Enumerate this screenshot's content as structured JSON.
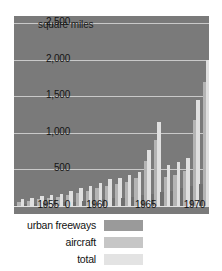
{
  "chart_data": {
    "type": "bar",
    "title": "",
    "ylabel": "square miles",
    "xlabel": "",
    "ylim": [
      0,
      2600
    ],
    "grid": true,
    "legend_position": "bottom",
    "ytick_labels": [
      "2,500",
      "2,000",
      "1,500",
      "1,000",
      "500",
      "0"
    ],
    "ytick_values": [
      2500,
      2000,
      1500,
      1000,
      500,
      0
    ],
    "xtick_labels": [
      "1955",
      "1960",
      "1965",
      "1970"
    ],
    "xtick_values": [
      1955,
      1960,
      1965,
      1970
    ],
    "categories": [
      1953,
      1954,
      1955,
      1956,
      1957,
      1958,
      1959,
      1960,
      1961,
      1962,
      1963,
      1964,
      1965,
      1966,
      1967,
      1968,
      1969,
      1970,
      1971,
      1972
    ],
    "series": [
      {
        "name": "urban freeways",
        "color": "#6f6f6f",
        "values": [
          20,
          25,
          30,
          40,
          45,
          55,
          60,
          70,
          80,
          95,
          105,
          115,
          130,
          150,
          170,
          190,
          210,
          240,
          270,
          300
        ]
      },
      {
        "name": "aircraft",
        "color": "#b4b4b4",
        "values": [
          60,
          70,
          90,
          110,
          120,
          150,
          180,
          210,
          240,
          280,
          300,
          330,
          380,
          620,
          900,
          400,
          430,
          480,
          1180,
          1700
        ]
      },
      {
        "name": "total",
        "color": "#e0e0e0",
        "values": [
          90,
          110,
          135,
          150,
          160,
          200,
          240,
          280,
          320,
          370,
          390,
          420,
          470,
          760,
          1150,
          560,
          600,
          660,
          1450,
          2000
        ]
      }
    ]
  },
  "legend": {
    "entries": [
      {
        "label": "urban freeways",
        "swatch": "s0"
      },
      {
        "label": "aircraft",
        "swatch": "s1"
      },
      {
        "label": "total",
        "swatch": "s2"
      }
    ]
  }
}
